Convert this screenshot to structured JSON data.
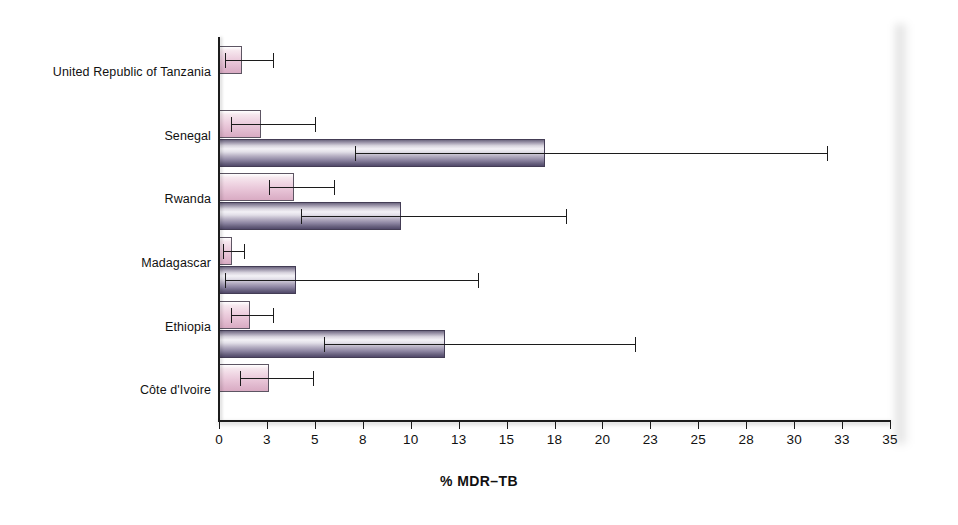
{
  "chart_data": {
    "type": "bar",
    "orientation": "horizontal",
    "title": "",
    "xlabel": "% MDR–TB",
    "ylabel": "",
    "xlim": [
      0,
      35
    ],
    "grid": false,
    "legend": "none",
    "tick_labels": [
      "0",
      "3",
      "5",
      "8",
      "10",
      "13",
      "15",
      "18",
      "20",
      "23",
      "25",
      "28",
      "30",
      "33",
      "35"
    ],
    "tick_values": [
      0,
      2.5,
      5,
      7.5,
      10,
      12.5,
      15,
      17.5,
      20,
      22.5,
      25,
      27.5,
      30,
      32.5,
      35
    ],
    "categories": [
      "United Republic of Tanzania",
      "Senegal",
      "Rwanda",
      "Madagascar",
      "Ethiopia",
      "Côte d'Ivoire"
    ],
    "series": [
      {
        "name": "new-cases",
        "color": "#e7c3d6",
        "values": [
          1.2,
          2.2,
          3.9,
          0.7,
          1.6,
          2.6
        ],
        "err_low": [
          0.3,
          0.6,
          2.6,
          0.2,
          0.6,
          1.1
        ],
        "err_high": [
          2.8,
          5.0,
          6.0,
          1.3,
          2.8,
          4.9
        ]
      },
      {
        "name": "previously-treated",
        "color": "#8b83a0",
        "values": [
          null,
          17.0,
          9.5,
          4.0,
          11.8,
          null
        ],
        "err_low": [
          null,
          7.1,
          4.3,
          0.3,
          5.5,
          null
        ],
        "err_high": [
          null,
          31.7,
          18.1,
          13.5,
          21.7,
          null
        ]
      }
    ]
  },
  "axis": {
    "x_title": "% MDR–TB"
  }
}
